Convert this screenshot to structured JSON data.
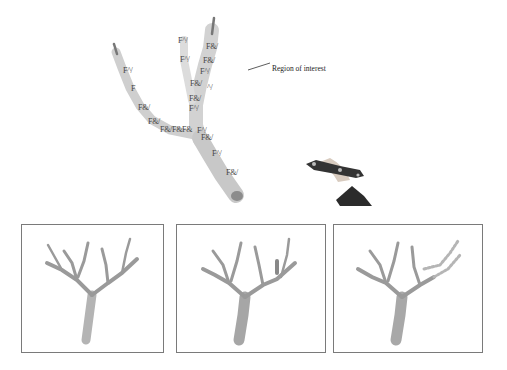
{
  "figure": {
    "callout_label": "Region of interest",
    "main_tree_labels": [
      {
        "text": "F^/",
        "x": 178,
        "y": 40
      },
      {
        "text": "F&/",
        "x": 206,
        "y": 46
      },
      {
        "text": "F^/",
        "x": 180,
        "y": 59
      },
      {
        "text": "F&/",
        "x": 203,
        "y": 60
      },
      {
        "text": "F^/",
        "x": 200,
        "y": 71
      },
      {
        "text": "F&/",
        "x": 190,
        "y": 83
      },
      {
        "text": "^/",
        "x": 207,
        "y": 87
      },
      {
        "text": "F&/",
        "x": 189,
        "y": 98
      },
      {
        "text": "F^/",
        "x": 189,
        "y": 108
      },
      {
        "text": "F^/",
        "x": 123,
        "y": 70
      },
      {
        "text": "F",
        "x": 131,
        "y": 88
      },
      {
        "text": "F&/",
        "x": 138,
        "y": 107
      },
      {
        "text": "F&/",
        "x": 148,
        "y": 121
      },
      {
        "text": "F&/F&F&",
        "x": 160,
        "y": 129
      },
      {
        "text": "F^/",
        "x": 197,
        "y": 130
      },
      {
        "text": "F&/",
        "x": 201,
        "y": 137
      },
      {
        "text": "F^/",
        "x": 212,
        "y": 153
      },
      {
        "text": "F&/",
        "x": 226,
        "y": 172
      }
    ],
    "panels": [
      {
        "id": "panel-1",
        "caption": ""
      },
      {
        "id": "panel-2",
        "caption": ""
      },
      {
        "id": "panel-3",
        "caption": ""
      }
    ],
    "colors": {
      "branch_fill": "#c9c9c9",
      "branch_dark": "#8a8a8a",
      "panel_border": "#7a7a7a",
      "tool_dark": "#2a2a2a"
    }
  }
}
